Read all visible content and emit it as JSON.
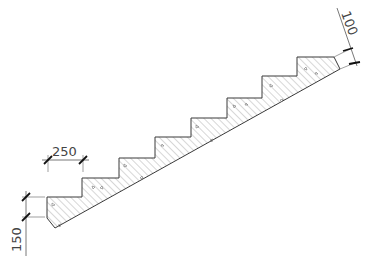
{
  "drawing": {
    "title": "Stair section",
    "colors": {
      "outline": "#3a3a3a",
      "hatch": "#9a9a9a",
      "dimension": "#555555",
      "tick": "#111111"
    },
    "dimensions": {
      "tread": {
        "label": "250"
      },
      "riser": {
        "label": "150"
      },
      "slab_thickness": {
        "label": "100"
      }
    },
    "step_count": 8,
    "hatch_pattern": "concrete-diagonal"
  }
}
